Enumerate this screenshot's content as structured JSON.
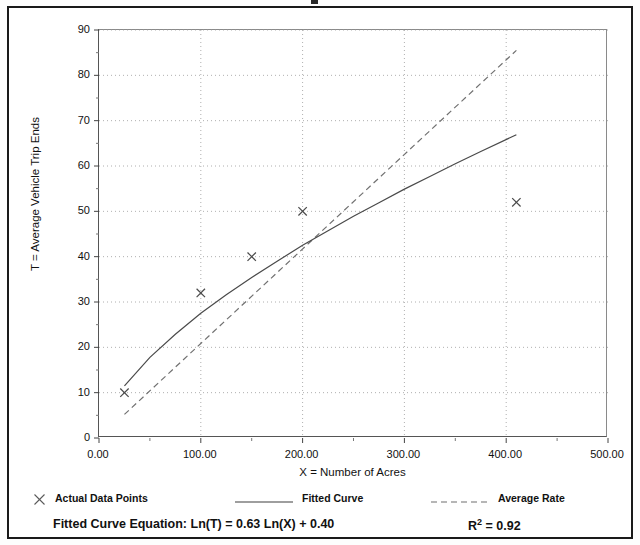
{
  "chart_data": {
    "type": "line",
    "title": "",
    "xlabel": "X = Number of Acres",
    "ylabel": "T = Average Vehicle Trip Ends",
    "xlim": [
      0,
      500
    ],
    "ylim": [
      0,
      90
    ],
    "grid": true,
    "x_ticks": [
      0,
      100,
      200,
      300,
      400,
      500
    ],
    "x_tick_labels": [
      "0.00",
      "100.00",
      "200.00",
      "300.00",
      "400.00",
      "500.00"
    ],
    "y_ticks": [
      0,
      10,
      20,
      30,
      40,
      50,
      60,
      70,
      80,
      90
    ],
    "y_tick_labels": [
      "0",
      "10",
      "20",
      "30",
      "40",
      "50",
      "60",
      "70",
      "80",
      "90"
    ],
    "y_minor_ticks": [
      5,
      15,
      25,
      35,
      45,
      55,
      65,
      75,
      85
    ],
    "legend_position": "below-axis",
    "series": [
      {
        "name": "Actual Data Points",
        "type": "scatter",
        "marker": "x",
        "color": "#4a4a4a",
        "points": [
          {
            "x": 25,
            "y": 10
          },
          {
            "x": 100,
            "y": 32
          },
          {
            "x": 150,
            "y": 40
          },
          {
            "x": 200,
            "y": 50
          },
          {
            "x": 410,
            "y": 52
          }
        ]
      },
      {
        "name": "Fitted Curve",
        "type": "line",
        "style": "solid",
        "color": "#4a4a4a",
        "equation": "Ln(T) = 0.63 Ln(X) + 0.40",
        "coefficient": 0.63,
        "intercept": 0.4,
        "x_start": 25,
        "x_end": 410,
        "points": [
          {
            "x": 25,
            "y": 11.5
          },
          {
            "x": 50,
            "y": 17.8
          },
          {
            "x": 75,
            "y": 22.9
          },
          {
            "x": 100,
            "y": 27.5
          },
          {
            "x": 125,
            "y": 31.6
          },
          {
            "x": 150,
            "y": 35.4
          },
          {
            "x": 175,
            "y": 39.0
          },
          {
            "x": 200,
            "y": 42.5
          },
          {
            "x": 225,
            "y": 45.7
          },
          {
            "x": 250,
            "y": 48.9
          },
          {
            "x": 275,
            "y": 51.9
          },
          {
            "x": 300,
            "y": 54.9
          },
          {
            "x": 325,
            "y": 57.7
          },
          {
            "x": 350,
            "y": 60.5
          },
          {
            "x": 375,
            "y": 63.2
          },
          {
            "x": 410,
            "y": 66.9
          }
        ]
      },
      {
        "name": "Average Rate",
        "type": "line",
        "style": "dashed",
        "color": "#707070",
        "x_start": 25,
        "x_end": 410,
        "points": [
          {
            "x": 25,
            "y": 5.2
          },
          {
            "x": 410,
            "y": 85.5
          }
        ]
      }
    ]
  },
  "legend": {
    "items": [
      {
        "label": "Actual Data Points",
        "marker": "x-marker-icon"
      },
      {
        "label": "Fitted Curve",
        "marker": "solid-line-icon"
      },
      {
        "label": "Average Rate",
        "marker": "dashed-line-icon"
      }
    ]
  },
  "footer": {
    "equation_label": "Fitted Curve Equation:",
    "equation_value": "Ln(T) = 0.63 Ln(X) + 0.40",
    "equation_full": "Fitted Curve Equation:  Ln(T) = 0.63 Ln(X) + 0.40",
    "r_squared_label": "R",
    "r_squared_sup": "2",
    "r_squared_value": "= 0.92"
  },
  "colors": {
    "frame": "#1a1a1a",
    "axis": "#555555",
    "grid": "#9a9a9a",
    "series_line": "#4a4a4a",
    "series_dash": "#707070",
    "background": "#ffffff"
  }
}
